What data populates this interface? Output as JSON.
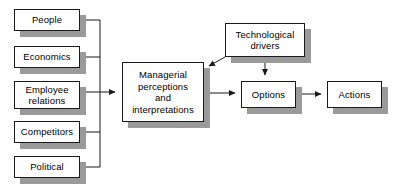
{
  "diagram": {
    "background_color": "#ffffff",
    "box_fill_color": "#ffffff",
    "box_border_color": "#1a1a1a",
    "shadow_color": "#9a9a9a",
    "line_color": "#1a1a1a",
    "nodes": [
      {
        "id": "people",
        "label": "People",
        "x": 14,
        "y": 9,
        "w": 66,
        "h": 22
      },
      {
        "id": "economics",
        "label": "Economics",
        "x": 14,
        "y": 46,
        "w": 66,
        "h": 22
      },
      {
        "id": "employee",
        "label": "Employee\nrelations",
        "x": 14,
        "y": 81,
        "w": 66,
        "h": 28
      },
      {
        "id": "competitors",
        "label": "Competitors",
        "x": 14,
        "y": 121,
        "w": 66,
        "h": 22
      },
      {
        "id": "political",
        "label": "Political",
        "x": 14,
        "y": 156,
        "w": 66,
        "h": 22
      },
      {
        "id": "managerial",
        "label": "Managerial\nperceptions\nand\ninterpretations",
        "x": 122,
        "y": 62,
        "w": 82,
        "h": 60
      },
      {
        "id": "technological",
        "label": "Technological\ndrivers",
        "x": 225,
        "y": 23,
        "w": 80,
        "h": 34
      },
      {
        "id": "options",
        "label": "Options",
        "x": 241,
        "y": 81,
        "w": 55,
        "h": 27
      },
      {
        "id": "actions",
        "label": "Actions",
        "x": 327,
        "y": 81,
        "w": 55,
        "h": 27
      }
    ],
    "edges": [
      {
        "id": "people-to-bus",
        "from": "people",
        "to": "bus",
        "arrow": false
      },
      {
        "id": "economics-to-bus",
        "from": "economics",
        "to": "bus",
        "arrow": false
      },
      {
        "id": "employee-to-bus",
        "from": "employee",
        "to": "bus",
        "arrow": false
      },
      {
        "id": "competitors-to-bus",
        "from": "competitors",
        "to": "bus",
        "arrow": false
      },
      {
        "id": "political-to-bus",
        "from": "political",
        "to": "bus",
        "arrow": false
      },
      {
        "id": "bus-to-managerial",
        "from": "bus",
        "to": "managerial",
        "arrow": true
      },
      {
        "id": "technological-to-managerial",
        "from": "technological",
        "to": "managerial",
        "arrow": true
      },
      {
        "id": "technological-to-options",
        "from": "technological",
        "to": "options",
        "arrow": true
      },
      {
        "id": "managerial-to-options",
        "from": "managerial",
        "to": "options",
        "arrow": true
      },
      {
        "id": "options-to-actions",
        "from": "options",
        "to": "actions",
        "arrow": true
      }
    ]
  }
}
